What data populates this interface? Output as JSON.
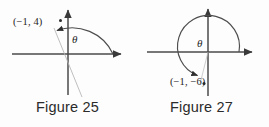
{
  "page": {
    "background_color": "#fdfdfd",
    "ink_color": "#3a3a3a",
    "width": 269,
    "height": 127
  },
  "figures": [
    {
      "id": "figure-25",
      "caption": "Figure 25",
      "point_label": "(−1, 4)",
      "angle_label": "θ",
      "quadrant": "II",
      "arc_direction": "counterclockwise",
      "arc_start_degrees": 0,
      "arc_end_degrees": 104,
      "axes": {
        "x_axis": "horizontal",
        "y_axis": "vertical"
      }
    },
    {
      "id": "figure-27",
      "caption": "Figure 27",
      "point_label": "(−1, −6)",
      "angle_label": "θ",
      "quadrant": "III",
      "arc_direction": "counterclockwise",
      "arc_start_degrees": 0,
      "arc_end_degrees": 260,
      "axes": {
        "x_axis": "horizontal",
        "y_axis": "vertical"
      }
    }
  ]
}
